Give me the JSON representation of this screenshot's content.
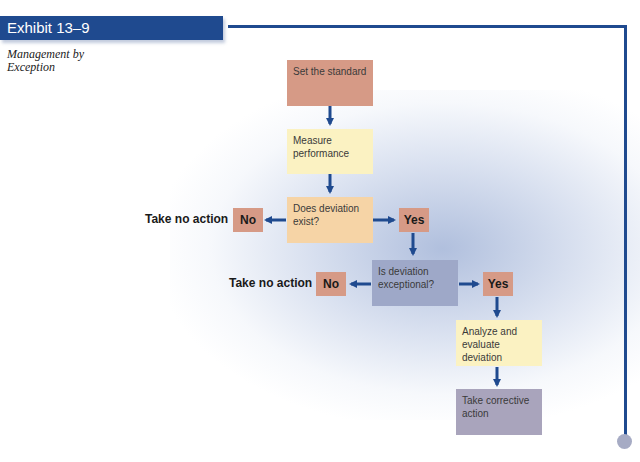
{
  "header": {
    "exhibit_label": "Exhibit 13–9",
    "subtitle_line1": "Management by",
    "subtitle_line2": "Exception"
  },
  "flowchart": {
    "steps": {
      "set_standard": "Set the standard",
      "measure": "Measure performance",
      "deviation_exist": "Does deviation exist?",
      "deviation_exceptional": "Is deviation exceptional?",
      "analyze": "Analyze and evaluate deviation",
      "corrective": "Take corrective action"
    },
    "decision1": {
      "no": "No",
      "yes": "Yes",
      "no_outcome": "Take no action"
    },
    "decision2": {
      "no": "No",
      "yes": "Yes",
      "no_outcome": "Take no action"
    }
  },
  "colors": {
    "accent_blue": "#1f4a8f",
    "box_pink": "#d69a86",
    "box_yellow": "#fbf2c2",
    "box_tan": "#f6d4a6",
    "box_blue": "#9ea8c8",
    "box_purple": "#a9a4bc"
  }
}
